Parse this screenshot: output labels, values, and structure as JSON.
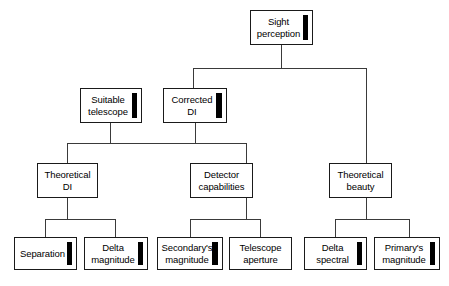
{
  "diagram": {
    "type": "tree",
    "orientation": "top-down",
    "colors": {
      "box_border": "#1a1a1a",
      "connector": "#3a3a3a",
      "marker": "#000000",
      "background": "#ffffff"
    },
    "levels": [
      {
        "level": 1,
        "nodes": [
          {
            "id": "sight-perception",
            "label": "Sight\nperception",
            "marker": true,
            "marker_weight": "normal"
          }
        ]
      },
      {
        "level": 2,
        "nodes": [
          {
            "id": "suitable-telescope",
            "label": "Suitable\ntelescope",
            "marker": true,
            "marker_weight": "normal"
          },
          {
            "id": "corrected-di",
            "label": "Corrected\nDI",
            "marker": true,
            "marker_weight": "thick"
          }
        ]
      },
      {
        "level": 3,
        "nodes": [
          {
            "id": "theoretical-di",
            "label": "Theoretical\nDI",
            "marker": false,
            "marker_weight": "none"
          },
          {
            "id": "detector-capabilities",
            "label": "Detector\ncapabilities",
            "marker": false,
            "marker_weight": "none"
          },
          {
            "id": "theoretical-beauty",
            "label": "Theoretical\nbeauty",
            "marker": false,
            "marker_weight": "none"
          }
        ]
      },
      {
        "level": 4,
        "nodes": [
          {
            "id": "separation",
            "label": "Separation",
            "marker": true,
            "marker_weight": "normal"
          },
          {
            "id": "delta-magnitude",
            "label": "Delta\nmagnitude",
            "marker": true,
            "marker_weight": "normal"
          },
          {
            "id": "secondarys-magnitude",
            "label": "Secondary's\nmagnitude",
            "marker": true,
            "marker_weight": "thick"
          },
          {
            "id": "telescope-aperture",
            "label": "Telescope\naperture",
            "marker": false,
            "marker_weight": "none"
          },
          {
            "id": "delta-spectral",
            "label": "Delta\nspectral",
            "marker": true,
            "marker_weight": "normal"
          },
          {
            "id": "primarys-magnitude",
            "label": "Primary's\nmagnitude",
            "marker": true,
            "marker_weight": "normal"
          }
        ]
      }
    ],
    "edges": [
      {
        "from": "sight-perception",
        "to": "corrected-di"
      },
      {
        "from": "sight-perception",
        "to": "theoretical-beauty"
      },
      {
        "from": "suitable-telescope",
        "to": "theoretical-di"
      },
      {
        "from": "corrected-di",
        "to": "theoretical-di"
      },
      {
        "from": "corrected-di",
        "to": "detector-capabilities"
      },
      {
        "from": "theoretical-di",
        "to": "separation"
      },
      {
        "from": "theoretical-di",
        "to": "delta-magnitude"
      },
      {
        "from": "detector-capabilities",
        "to": "secondarys-magnitude"
      },
      {
        "from": "detector-capabilities",
        "to": "telescope-aperture"
      },
      {
        "from": "theoretical-beauty",
        "to": "delta-spectral"
      },
      {
        "from": "theoretical-beauty",
        "to": "primarys-magnitude"
      }
    ]
  }
}
